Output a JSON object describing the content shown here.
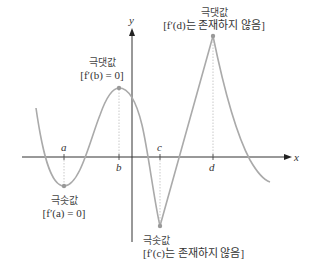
{
  "axes": {
    "x_label": "x",
    "y_label": "y",
    "ticks": [
      "a",
      "b",
      "c",
      "d"
    ]
  },
  "annotations": {
    "local_max_b": {
      "title": "극댓값",
      "condition": "[f′(b) = 0]"
    },
    "local_max_d": {
      "title": "극댓값",
      "condition": "[f′(d)는 존재하지 않음]"
    },
    "local_min_a": {
      "title": "극솟값",
      "condition": "[f′(a) = 0]"
    },
    "local_min_c": {
      "title": "극솟값",
      "condition": "[f′(c)는 존재하지 않음]"
    }
  },
  "colors": {
    "curve": "#aaaaaa",
    "axis": "#333333",
    "guide": "#bbbbbb",
    "point": "#999999"
  }
}
